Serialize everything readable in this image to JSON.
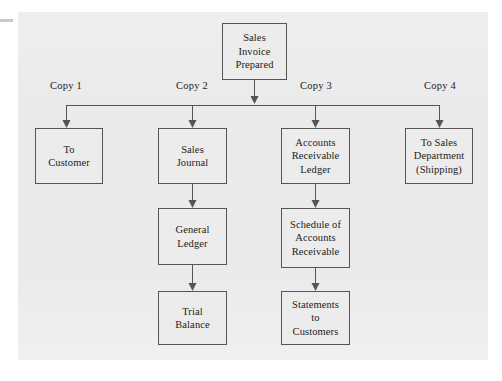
{
  "diagram": {
    "type": "flowchart",
    "orientation": "top-down",
    "background_color": "#eaeaea",
    "box_fill_color": "#ececec",
    "line_color": "#555555",
    "root": {
      "id": "sales-invoice-prepared",
      "lines": [
        "Sales",
        "Invoice",
        "Prepared"
      ]
    },
    "branch_labels": [
      {
        "id": "copy-1",
        "text": "Copy 1"
      },
      {
        "id": "copy-2",
        "text": "Copy 2"
      },
      {
        "id": "copy-3",
        "text": "Copy 3"
      },
      {
        "id": "copy-4",
        "text": "Copy 4"
      }
    ],
    "branches": [
      {
        "label": "Copy 1",
        "chain": [
          {
            "id": "to-customer",
            "lines": [
              "To",
              "Customer"
            ]
          }
        ]
      },
      {
        "label": "Copy 2",
        "chain": [
          {
            "id": "sales-journal",
            "lines": [
              "Sales",
              "Journal"
            ]
          },
          {
            "id": "general-ledger",
            "lines": [
              "General",
              "Ledger"
            ]
          },
          {
            "id": "trial-balance",
            "lines": [
              "Trial",
              "Balance"
            ]
          }
        ]
      },
      {
        "label": "Copy 3",
        "chain": [
          {
            "id": "accounts-receivable-ledger",
            "lines": [
              "Accounts",
              "Receivable",
              "Ledger"
            ]
          },
          {
            "id": "schedule-of-accounts-receivable",
            "lines": [
              "Schedule of",
              "Accounts",
              "Receivable"
            ]
          },
          {
            "id": "statements-to-customers",
            "lines": [
              "Statements",
              "to",
              "Customers"
            ]
          }
        ]
      },
      {
        "label": "Copy 4",
        "chain": [
          {
            "id": "to-sales-department",
            "lines": [
              "To Sales",
              "Department",
              "(Shipping)"
            ]
          }
        ]
      }
    ]
  }
}
